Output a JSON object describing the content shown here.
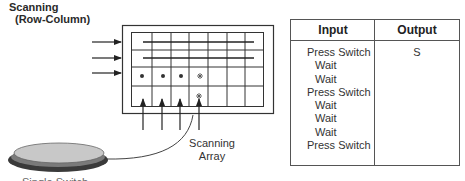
{
  "title": {
    "line1": "Scanning",
    "line2": "(Row-Column)"
  },
  "diagram": {
    "grid": {
      "rows": 4,
      "columns": 7
    },
    "row_arrows": 3,
    "column_arrows": 4,
    "selected_row_dots": 3,
    "asterisk_marks": [
      "*",
      "*"
    ],
    "scanning_array_label_line1": "Scanning",
    "scanning_array_label_line2": "Array",
    "switch_label": "Single Switch",
    "colors": {
      "line": "#2a2a2a",
      "switch_top": "#c8c8c8",
      "switch_base": "#3a3a3a"
    }
  },
  "table": {
    "headers": {
      "input": "Input",
      "output": "Output"
    },
    "rows": [
      {
        "input": "Press Switch",
        "output": "S"
      },
      {
        "input": "Wait",
        "output": ""
      },
      {
        "input": "Wait",
        "output": ""
      },
      {
        "input": "Press Switch",
        "output": ""
      },
      {
        "input": "Wait",
        "output": ""
      },
      {
        "input": "Wait",
        "output": ""
      },
      {
        "input": "Wait",
        "output": ""
      },
      {
        "input": "Press Switch",
        "output": ""
      }
    ]
  }
}
